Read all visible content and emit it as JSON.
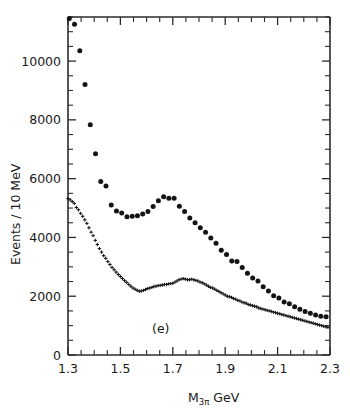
{
  "figure": {
    "panel_label": "(e)",
    "xlabel_main": "M",
    "xlabel_sub": "3π",
    "xlabel_unit": " GeV",
    "ylabel": "Events / 10 MeV",
    "ink_color": "#141414",
    "axis_color": "#2b2b2b",
    "background": "#ffffff"
  },
  "chart_data": {
    "type": "scatter",
    "title": "",
    "subtitle": "",
    "xlabel": "M_3π GeV",
    "ylabel": "Events / 10 MeV",
    "annotations": [
      "(e)"
    ],
    "grid": false,
    "legend": "none",
    "xlim": [
      1.3,
      2.3
    ],
    "ylim": [
      0,
      11500
    ],
    "xticks": [
      1.3,
      1.5,
      1.7,
      1.9,
      2.1,
      2.3
    ],
    "xtick_labels": [
      "1.3",
      "1.5",
      "1.7",
      "1.9",
      "2.1",
      "2.3"
    ],
    "xtick_minor_step": 0.05,
    "yticks": [
      0,
      2000,
      4000,
      6000,
      8000,
      10000
    ],
    "ytick_labels": [
      "0",
      "2000",
      "4000",
      "6000",
      "8000",
      "10000"
    ],
    "ytick_minor_step": 500,
    "series": [
      {
        "name": "upper-points",
        "marker": "filled-circle",
        "x": [
          1.305,
          1.325,
          1.345,
          1.365,
          1.385,
          1.405,
          1.425,
          1.445,
          1.465,
          1.485,
          1.505,
          1.525,
          1.545,
          1.565,
          1.585,
          1.605,
          1.625,
          1.645,
          1.665,
          1.685,
          1.705,
          1.725,
          1.745,
          1.765,
          1.785,
          1.805,
          1.825,
          1.845,
          1.865,
          1.885,
          1.905,
          1.925,
          1.945,
          1.965,
          1.985,
          2.005,
          2.025,
          2.045,
          2.065,
          2.085,
          2.105,
          2.125,
          2.145,
          2.165,
          2.185,
          2.205,
          2.225,
          2.245,
          2.265,
          2.285
        ],
        "y": [
          11450,
          11250,
          10350,
          9200,
          7830,
          6850,
          5900,
          5750,
          5100,
          4900,
          4830,
          4700,
          4720,
          4740,
          4800,
          4880,
          5050,
          5250,
          5380,
          5330,
          5330,
          5060,
          4880,
          4660,
          4500,
          4330,
          4180,
          3980,
          3800,
          3560,
          3420,
          3200,
          3180,
          2980,
          2780,
          2620,
          2520,
          2320,
          2180,
          2020,
          1940,
          1800,
          1740,
          1640,
          1560,
          1480,
          1420,
          1360,
          1320,
          1300
        ]
      },
      {
        "name": "lower-points",
        "marker": "cross",
        "x": [
          1.3,
          1.308,
          1.316,
          1.324,
          1.332,
          1.34,
          1.348,
          1.356,
          1.364,
          1.372,
          1.38,
          1.388,
          1.396,
          1.404,
          1.412,
          1.42,
          1.428,
          1.436,
          1.444,
          1.452,
          1.46,
          1.468,
          1.476,
          1.484,
          1.492,
          1.5,
          1.508,
          1.516,
          1.524,
          1.532,
          1.54,
          1.548,
          1.556,
          1.564,
          1.572,
          1.58,
          1.588,
          1.596,
          1.604,
          1.612,
          1.62,
          1.628,
          1.636,
          1.644,
          1.652,
          1.66,
          1.668,
          1.676,
          1.684,
          1.692,
          1.7,
          1.708,
          1.716,
          1.724,
          1.732,
          1.74,
          1.748,
          1.756,
          1.764,
          1.772,
          1.78,
          1.788,
          1.796,
          1.804,
          1.812,
          1.82,
          1.828,
          1.836,
          1.844,
          1.852,
          1.86,
          1.868,
          1.876,
          1.884,
          1.892,
          1.9,
          1.908,
          1.916,
          1.924,
          1.932,
          1.94,
          1.948,
          1.956,
          1.964,
          1.972,
          1.98,
          1.988,
          1.996,
          2.004,
          2.012,
          2.02,
          2.028,
          2.036,
          2.044,
          2.052,
          2.06,
          2.068,
          2.076,
          2.084,
          2.092,
          2.1,
          2.108,
          2.116,
          2.124,
          2.132,
          2.14,
          2.148,
          2.156,
          2.164,
          2.172,
          2.18,
          2.188,
          2.196,
          2.204,
          2.212,
          2.22,
          2.228,
          2.236,
          2.244,
          2.252,
          2.26,
          2.268,
          2.276,
          2.284,
          2.292
        ],
        "y": [
          5320,
          5280,
          5220,
          5160,
          5020,
          4940,
          4820,
          4720,
          4600,
          4480,
          4330,
          4180,
          4060,
          3900,
          3760,
          3620,
          3500,
          3380,
          3290,
          3180,
          3080,
          2980,
          2900,
          2820,
          2740,
          2670,
          2600,
          2530,
          2470,
          2400,
          2340,
          2280,
          2240,
          2200,
          2170,
          2180,
          2200,
          2230,
          2260,
          2280,
          2300,
          2330,
          2340,
          2360,
          2370,
          2380,
          2400,
          2400,
          2420,
          2430,
          2440,
          2480,
          2520,
          2560,
          2580,
          2600,
          2580,
          2560,
          2560,
          2580,
          2560,
          2540,
          2520,
          2480,
          2460,
          2420,
          2380,
          2340,
          2300,
          2280,
          2240,
          2200,
          2160,
          2120,
          2080,
          2040,
          2000,
          1980,
          1960,
          1920,
          1900,
          1860,
          1840,
          1800,
          1780,
          1760,
          1720,
          1700,
          1680,
          1660,
          1640,
          1600,
          1580,
          1560,
          1540,
          1520,
          1500,
          1480,
          1460,
          1440,
          1420,
          1400,
          1380,
          1360,
          1340,
          1320,
          1300,
          1280,
          1260,
          1240,
          1220,
          1200,
          1180,
          1160,
          1140,
          1120,
          1100,
          1080,
          1060,
          1040,
          1020,
          1000,
          980,
          960,
          940
        ]
      }
    ]
  }
}
